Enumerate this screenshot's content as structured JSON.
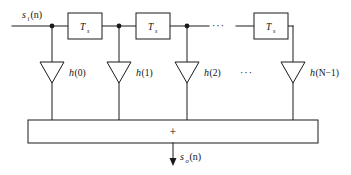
{
  "diagram": {
    "type": "signal-flow-block-diagram",
    "colors": {
      "background": "#ffffff",
      "stroke": "#1a1a1a",
      "text": "#111111"
    },
    "input": {
      "label_base": "s",
      "label_subscript": "i",
      "label_arg": "(n)",
      "label_full": "sᵢ(n)"
    },
    "output": {
      "label_base": "s",
      "label_subscript": "o",
      "label_arg": "(n)",
      "label_full": "sₒ(n)"
    },
    "delay_elements": [
      {
        "id": "delay-1",
        "label_base": "T",
        "label_subscript": "s",
        "label_full": "Ts"
      },
      {
        "id": "delay-2",
        "label_base": "T",
        "label_subscript": "s",
        "label_full": "Ts"
      },
      {
        "id": "delay-n",
        "label_base": "T",
        "label_subscript": "s",
        "label_full": "Ts"
      }
    ],
    "taps": [
      {
        "id": "tap-0",
        "coefficient": "h",
        "argument": "(0)"
      },
      {
        "id": "tap-1",
        "coefficient": "h",
        "argument": "(1)"
      },
      {
        "id": "tap-2",
        "coefficient": "h",
        "argument": "(2)"
      },
      {
        "id": "tap-last",
        "coefficient": "h",
        "argument": "(N−1)"
      }
    ],
    "adder": {
      "symbol": "+",
      "name": "summing-junction"
    },
    "ellipses": {
      "top": "···",
      "middle": "···"
    }
  }
}
